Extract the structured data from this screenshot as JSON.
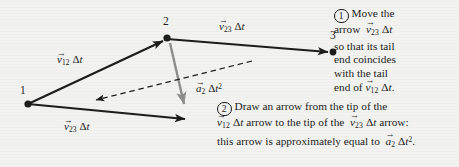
{
  "figure": {
    "background_color": "#f2f2f0",
    "ink_color": "#1a1a1a",
    "gray_arrow_color": "#8c8c8c"
  },
  "nodes": [
    {
      "id": "node-1",
      "label": "1",
      "x": 28,
      "y": 104
    },
    {
      "id": "node-2",
      "label": "2",
      "x": 167,
      "y": 38
    },
    {
      "id": "node-3",
      "label": "3",
      "x": 333,
      "y": 52
    }
  ],
  "vectors": [
    {
      "id": "v12-upper",
      "name": "v12-delta-t",
      "style": "solid",
      "color": "#1a1a1a",
      "from": [
        28,
        104
      ],
      "to": [
        167,
        38
      ],
      "label": {
        "symbol": "v",
        "sub": "12",
        "factor": "Δt",
        "sup": ""
      }
    },
    {
      "id": "v23-upper",
      "name": "v23-delta-t-top",
      "style": "solid",
      "color": "#1a1a1a",
      "from": [
        167,
        38
      ],
      "to": [
        333,
        52
      ],
      "label": {
        "symbol": "v",
        "sub": "23",
        "factor": "Δt",
        "sup": ""
      }
    },
    {
      "id": "v23-lower",
      "name": "v23-delta-t-translated",
      "style": "solid",
      "color": "#1a1a1a",
      "from": [
        28,
        104
      ],
      "to": [
        190,
        120
      ],
      "label": {
        "symbol": "v",
        "sub": "23",
        "factor": "Δt",
        "sup": ""
      }
    },
    {
      "id": "a2-gray",
      "name": "a2-delta-t-squared",
      "style": "solid-gray",
      "color": "#8c8c8c",
      "from": [
        170,
        43
      ],
      "to": [
        186,
        113
      ],
      "label": {
        "symbol": "a",
        "sub": "2",
        "factor": "Δt",
        "sup": "2"
      }
    },
    {
      "id": "dashed-connector",
      "name": "dashed-construction-arrow",
      "style": "dashed",
      "color": "#1a1a1a",
      "from": [
        250,
        62
      ],
      "to": [
        92,
        101
      ],
      "label": null
    }
  ],
  "vector_labels": [
    {
      "name": "label-v12-delta-t",
      "symbol": "v",
      "sub": "12",
      "factor": "Δt",
      "sup": "",
      "x": 57,
      "y": 55
    },
    {
      "name": "label-v23-delta-t-top",
      "symbol": "v",
      "sub": "23",
      "factor": "Δt",
      "sup": "",
      "x": 218,
      "y": 22
    },
    {
      "name": "label-v23-delta-t-bottom",
      "symbol": "v",
      "sub": "23",
      "factor": "Δt",
      "sup": "",
      "x": 64,
      "y": 120
    },
    {
      "name": "label-a2-delta-t-squared",
      "symbol": "a",
      "sub": "2",
      "factor": "Δt",
      "sup": "2",
      "x": 196,
      "y": 84
    }
  ],
  "annotations": [
    {
      "name": "annotation-step-1",
      "marker": "1",
      "x": 334,
      "y": 8,
      "lines": [
        "Move the",
        "arrow v23 Δt",
        "so that its tail",
        "end coincides",
        "with the tail",
        "end of v12 Δt."
      ]
    },
    {
      "name": "annotation-step-2",
      "marker": "2",
      "x": 217,
      "y": 101,
      "lines": [
        "Draw an arrow from the tip of the",
        "v12 Δt arrow to the tip of the v23 Δt arrow:",
        "this arrow is approximately equal to a2 Δt²."
      ]
    }
  ]
}
